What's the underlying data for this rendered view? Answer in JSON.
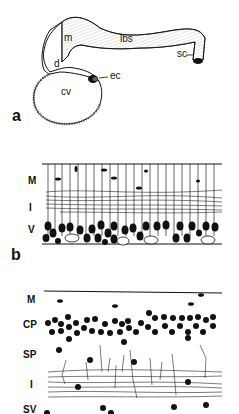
{
  "figure": {
    "panels": [
      {
        "id": "a",
        "letter": "a",
        "labels": {
          "m": "m",
          "lbs": "lbs",
          "sc": "sc",
          "d": "d",
          "ec": "ec",
          "cv": "cv"
        }
      },
      {
        "id": "b",
        "letter": "b",
        "layers": [
          "M",
          "I",
          "V"
        ]
      },
      {
        "id": "c",
        "letter": "",
        "layers": [
          "M",
          "CP",
          "SP",
          "I",
          "SV"
        ]
      }
    ],
    "colors": {
      "ink": "#111111",
      "background": "#ffffff"
    }
  }
}
